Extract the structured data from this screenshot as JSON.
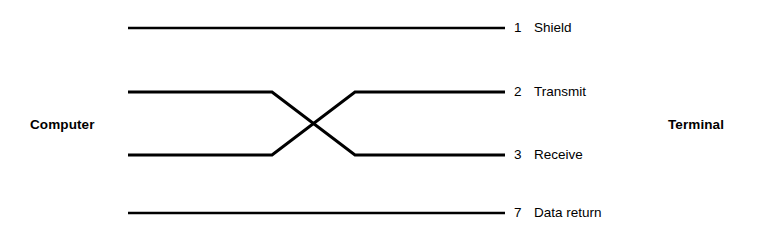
{
  "diagram": {
    "type": "wiring-diagram",
    "line_color": "#000000",
    "background_color": "#ffffff",
    "stroke_width": 2.4,
    "endpoints": {
      "left_label": "Computer",
      "right_label": "Terminal"
    },
    "pins": [
      {
        "number": "1",
        "name": "Shield",
        "routing": "straight",
        "y": 28
      },
      {
        "number": "2",
        "name": "Transmit",
        "routing": "crossover-down",
        "y": 92
      },
      {
        "number": "3",
        "name": "Receive",
        "routing": "crossover-up",
        "y": 155
      },
      {
        "number": "7",
        "name": "Data return",
        "routing": "straight",
        "y": 213
      }
    ],
    "geometry": {
      "line_start_x": 128,
      "line_end_x": 505,
      "cross_left_x": 272,
      "cross_right_x": 355,
      "upper_y": 92,
      "lower_y": 155,
      "shield_y": 28,
      "data_return_y": 213
    }
  }
}
